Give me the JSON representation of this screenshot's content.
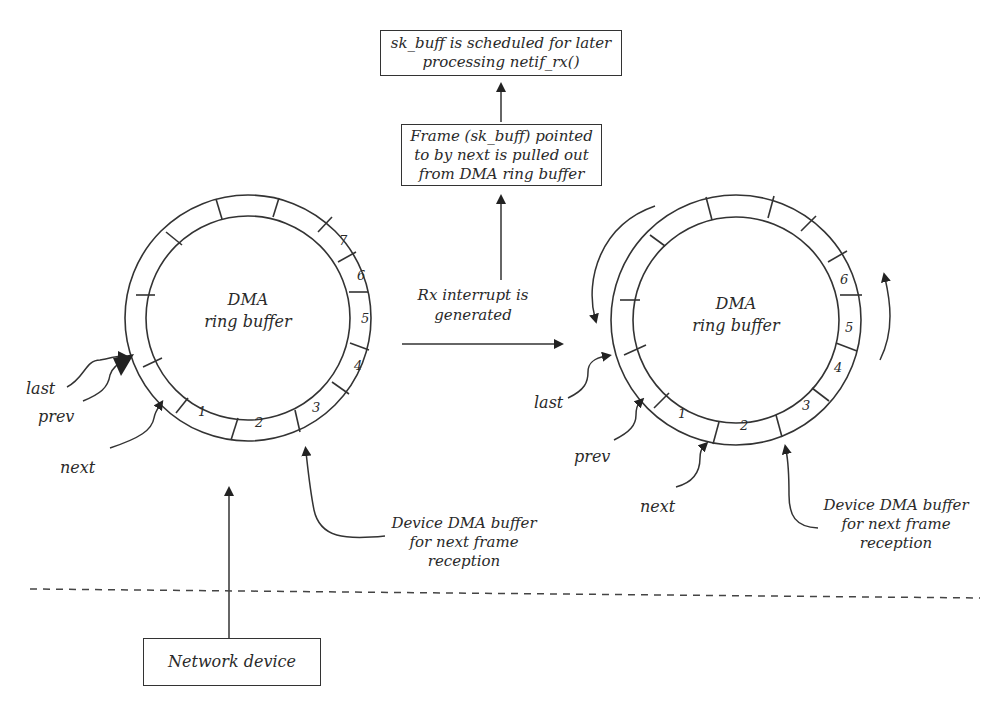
{
  "diagram": {
    "boxes": {
      "scheduled": {
        "line1": "sk_buff is scheduled for later",
        "line2": "processing netif_rx()"
      },
      "pulled": {
        "line1": "Frame (sk_buff) pointed",
        "line2": "to by next is pulled out",
        "line3": "from DMA ring buffer"
      },
      "network_device": "Network device"
    },
    "rx_interrupt": {
      "line1": "Rx interrupt is",
      "line2": "generated"
    },
    "left_ring": {
      "title1": "DMA",
      "title2": "ring buffer",
      "slots": [
        "1",
        "2",
        "3",
        "4",
        "5",
        "6",
        "7"
      ],
      "pointers": {
        "last": "last",
        "prev": "prev",
        "next": "next"
      },
      "device_label": {
        "line1": "Device DMA buffer",
        "line2": "for next frame",
        "line3": "reception"
      }
    },
    "right_ring": {
      "title1": "DMA",
      "title2": "ring buffer",
      "slots": [
        "1",
        "2",
        "3",
        "4",
        "5",
        "6"
      ],
      "pointers": {
        "last": "last",
        "prev": "prev",
        "next": "next"
      },
      "device_label": {
        "line1": "Device DMA buffer",
        "line2": "for next frame",
        "line3": "reception"
      }
    },
    "colors": {
      "ink": "#2a2a2a",
      "background": "#ffffff"
    }
  }
}
